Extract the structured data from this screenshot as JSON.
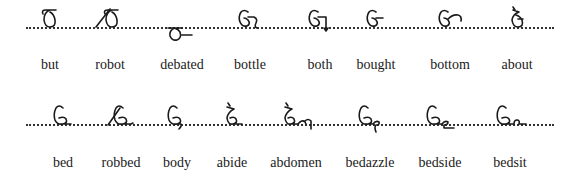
{
  "rows": [
    {
      "words": [
        {
          "label": "but",
          "outline": "b-t",
          "position": "on-line"
        },
        {
          "label": "robot",
          "outline": "r-b-t",
          "position": "on-line"
        },
        {
          "label": "debated",
          "outline": "d-b-t-d",
          "position": "below-line"
        },
        {
          "label": "bottle",
          "outline": "b-t-l",
          "position": "on-line"
        },
        {
          "label": "both",
          "outline": "b-th",
          "position": "on-line"
        },
        {
          "label": "bought",
          "outline": "b-t",
          "position": "on-line"
        },
        {
          "label": "bottom",
          "outline": "b-t-m",
          "position": "on-line"
        },
        {
          "label": "about",
          "outline": "a-b-t",
          "position": "on-line"
        }
      ]
    },
    {
      "words": [
        {
          "label": "bed",
          "outline": "b-d",
          "position": "on-line"
        },
        {
          "label": "robbed",
          "outline": "r-b-d",
          "position": "on-line"
        },
        {
          "label": "body",
          "outline": "b-d-y",
          "position": "on-line"
        },
        {
          "label": "abide",
          "outline": "a-b-d",
          "position": "on-line"
        },
        {
          "label": "abdomen",
          "outline": "a-b-d-m-n",
          "position": "on-line"
        },
        {
          "label": "bedazzle",
          "outline": "b-d-z-l",
          "position": "on-line"
        },
        {
          "label": "bedside",
          "outline": "b-d-s-d",
          "position": "on-line"
        },
        {
          "label": "bedsit",
          "outline": "b-d-s-t",
          "position": "on-line"
        }
      ]
    }
  ]
}
